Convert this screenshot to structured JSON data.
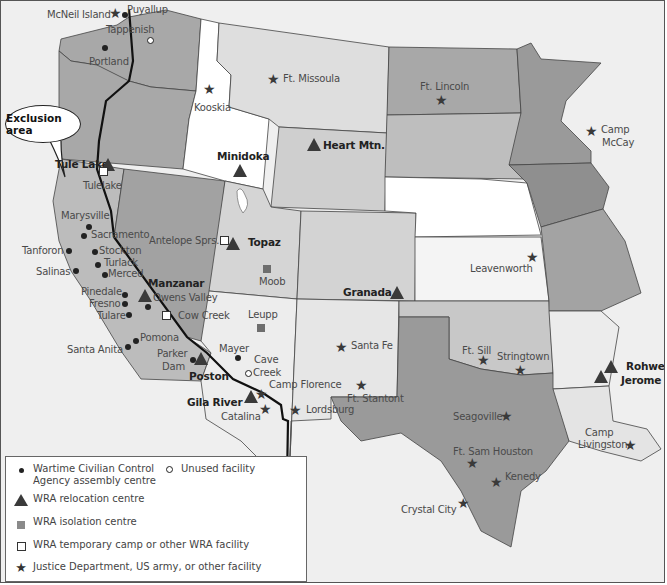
{
  "map": {
    "callout": "Exclusion area",
    "colors": {
      "background": "#efefef",
      "exclusion_area": "#a8a8a8",
      "dark_state": "#9c9c9c",
      "mid_state": "#c8c8c8",
      "light_state": "#dedede",
      "white_state": "#ffffff",
      "marker": "#3a3a3a"
    },
    "places": [
      {
        "name": "McNeil Island",
        "type": "justice"
      },
      {
        "name": "Puyallup",
        "type": "assembly"
      },
      {
        "name": "Tappenish",
        "type": "unused"
      },
      {
        "name": "Portland",
        "type": "assembly"
      },
      {
        "name": "Kooskia",
        "type": "justice"
      },
      {
        "name": "Ft. Missoula",
        "type": "justice"
      },
      {
        "name": "Ft. Lincoln",
        "type": "justice"
      },
      {
        "name": "Camp McCay",
        "type": "justice"
      },
      {
        "name": "Heart Mtn.",
        "type": "relocation"
      },
      {
        "name": "Minidoka",
        "type": "relocation"
      },
      {
        "name": "Tule Lake",
        "type": "relocation"
      },
      {
        "name": "Tulelake",
        "type": "temporary"
      },
      {
        "name": "Marysville",
        "type": "assembly"
      },
      {
        "name": "Sacramento",
        "type": "assembly"
      },
      {
        "name": "Tanforon",
        "type": "assembly"
      },
      {
        "name": "Stockton",
        "type": "assembly"
      },
      {
        "name": "Turlack",
        "type": "assembly"
      },
      {
        "name": "Merced",
        "type": "assembly"
      },
      {
        "name": "Salinas",
        "type": "assembly"
      },
      {
        "name": "Antelope Sprs.",
        "type": "temporary"
      },
      {
        "name": "Topaz",
        "type": "relocation"
      },
      {
        "name": "Moob",
        "type": "isolation"
      },
      {
        "name": "Manzanar",
        "type": "relocation"
      },
      {
        "name": "Owens Valley",
        "type": "assembly"
      },
      {
        "name": "Pinedale",
        "type": "assembly"
      },
      {
        "name": "Fresno",
        "type": "assembly"
      },
      {
        "name": "Tulare",
        "type": "assembly"
      },
      {
        "name": "Cow Creek",
        "type": "temporary"
      },
      {
        "name": "Leupp",
        "type": "isolation"
      },
      {
        "name": "Granada",
        "type": "relocation"
      },
      {
        "name": "Leavenworth",
        "type": "justice"
      },
      {
        "name": "Pomona",
        "type": "assembly"
      },
      {
        "name": "Santa Anita",
        "type": "assembly"
      },
      {
        "name": "Parker Dam",
        "type": "assembly"
      },
      {
        "name": "Poston",
        "type": "relocation"
      },
      {
        "name": "Mayer",
        "type": "assembly"
      },
      {
        "name": "Cave Creek",
        "type": "unused"
      },
      {
        "name": "Santa Fe",
        "type": "justice"
      },
      {
        "name": "Camp Florence",
        "type": "justice"
      },
      {
        "name": "Ft. Stantont",
        "type": "justice"
      },
      {
        "name": "Gila River",
        "type": "relocation"
      },
      {
        "name": "Catalina",
        "type": "justice"
      },
      {
        "name": "Lordsburg",
        "type": "justice"
      },
      {
        "name": "Ft. Sill",
        "type": "justice"
      },
      {
        "name": "Stringtown",
        "type": "justice"
      },
      {
        "name": "Rohwer",
        "type": "relocation"
      },
      {
        "name": "Jerome",
        "type": "relocation"
      },
      {
        "name": "Seagoville",
        "type": "justice"
      },
      {
        "name": "Camp Livingston",
        "type": "justice"
      },
      {
        "name": "Ft. Sam Houston",
        "type": "justice"
      },
      {
        "name": "Kenedy",
        "type": "justice"
      },
      {
        "name": "Crystal City",
        "type": "justice"
      }
    ]
  },
  "labels": {
    "mcneil": "McNeil Island",
    "puyallup": "Puyallup",
    "tappenish": "Tappenish",
    "portland": "Portland",
    "kooskia": "Kooskia",
    "missoula": "Ft. Missoula",
    "lincoln": "Ft. Lincoln",
    "mccay1": "Camp",
    "mccay2": "McCay",
    "heart": "Heart Mtn.",
    "minidoka": "Minidoka",
    "tulelake_camp": "Tule Lake",
    "tulelake_town": "Tulelake",
    "marysville": "Marysville",
    "sacramento": "Sacramento",
    "tanforon": "Tanforon",
    "stockton": "Stockton",
    "turlack": "Turlack",
    "merced": "Merced",
    "salinas": "Salinas",
    "antelope": "Antelope Sprs.",
    "topaz": "Topaz",
    "moob": "Moob",
    "manzanar": "Manzanar",
    "owens": "Owens Valley",
    "pinedale": "Pinedale",
    "fresno": "Fresno",
    "tulare": "Tulare",
    "cowcreek": "Cow Creek",
    "leupp": "Leupp",
    "granada": "Granada",
    "leavenworth": "Leavenworth",
    "pomona": "Pomona",
    "santaanita": "Santa Anita",
    "parker1": "Parker",
    "parker2": "Dam",
    "poston": "Poston",
    "mayer": "Mayer",
    "cave1": "Cave",
    "cave2": "Creek",
    "santafe": "Santa Fe",
    "florence": "Camp Florence",
    "stantont": "Ft. Stantont",
    "gila": "Gila River",
    "catalina": "Catalina",
    "lordsburg": "Lordsburg",
    "sill": "Ft. Sill",
    "stringtown": "Stringtown",
    "rohwer": "Rohwer",
    "jerome": "Jerome",
    "seagoville": "Seagoville",
    "livingston1": "Camp",
    "livingston2": "Livingston",
    "samhouston": "Ft. Sam Houston",
    "kenedy": "Kenedy",
    "crystal": "Crystal City"
  },
  "legend": {
    "items": [
      {
        "symbol": "dot",
        "label_line1": "Wartime Civilian Control",
        "label_line2": "Agency assembly centre"
      },
      {
        "symbol": "open-circle",
        "label_line1": "Unused facility"
      },
      {
        "symbol": "triangle",
        "label_line1": "WRA relocation centre"
      },
      {
        "symbol": "filled-square",
        "label_line1": "WRA isolation centre"
      },
      {
        "symbol": "open-square",
        "label_line1": "WRA temporary camp or other WRA facility"
      },
      {
        "symbol": "star",
        "label_line1": "Justice Department, US army, or other facility"
      }
    ]
  }
}
